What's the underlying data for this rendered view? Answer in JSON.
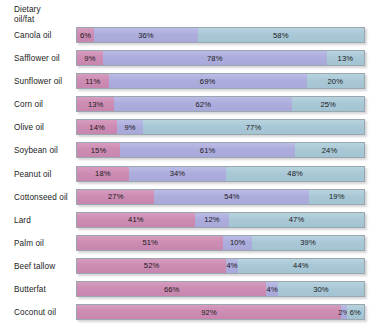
{
  "axis": {
    "title_line1": "Dietary",
    "title_line2": "oil/fat"
  },
  "colors": {
    "saturated": "#cc8cb3",
    "polyunsaturated": "#adaddd",
    "monounsaturated": "#a9c8d6",
    "bar_border": "#9aa7ae",
    "background": "#ffffff",
    "text": "#1c1c1c"
  },
  "chart_data": {
    "type": "bar",
    "orientation": "horizontal",
    "stacked": true,
    "normalized": true,
    "title": "",
    "subtitle": "",
    "xlabel": "",
    "ylabel": "Dietary oil/fat",
    "xlim": [
      0,
      100
    ],
    "grid": false,
    "legend_position": "none",
    "value_suffix": "%",
    "categories": [
      "Canola oil",
      "Safflower oil",
      "Sunflower oil",
      "Corn oil",
      "Olive oil",
      "Soybean oil",
      "Peanut oil",
      "Cottonseed oil",
      "Lard",
      "Palm oil",
      "Beef tallow",
      "Butterfat",
      "Coconut oil"
    ],
    "series": [
      {
        "name": "Saturated fat",
        "color": "#cc8cb3",
        "values": [
          6,
          9,
          11,
          13,
          14,
          15,
          18,
          27,
          41,
          51,
          52,
          66,
          92
        ]
      },
      {
        "name": "Polyunsaturated fat",
        "color": "#adaddd",
        "values": [
          36,
          78,
          69,
          62,
          9,
          61,
          34,
          54,
          12,
          10,
          4,
          4,
          2
        ]
      },
      {
        "name": "Monounsaturated fat",
        "color": "#a9c8d6",
        "values": [
          58,
          13,
          20,
          25,
          77,
          24,
          48,
          19,
          47,
          39,
          44,
          30,
          6
        ]
      }
    ],
    "rows": [
      {
        "label": "Canola oil",
        "segments": [
          {
            "series": "Saturated fat",
            "value": 6,
            "text": "6%"
          },
          {
            "series": "Polyunsaturated fat",
            "value": 36,
            "text": "36%"
          },
          {
            "series": "Monounsaturated fat",
            "value": 58,
            "text": "58%"
          }
        ]
      },
      {
        "label": "Safflower oil",
        "segments": [
          {
            "series": "Saturated fat",
            "value": 9,
            "text": "9%"
          },
          {
            "series": "Polyunsaturated fat",
            "value": 78,
            "text": "78%"
          },
          {
            "series": "Monounsaturated fat",
            "value": 13,
            "text": "13%"
          }
        ]
      },
      {
        "label": "Sunflower oil",
        "segments": [
          {
            "series": "Saturated fat",
            "value": 11,
            "text": "11%"
          },
          {
            "series": "Polyunsaturated fat",
            "value": 69,
            "text": "69%"
          },
          {
            "series": "Monounsaturated fat",
            "value": 20,
            "text": "20%"
          }
        ]
      },
      {
        "label": "Corn oil",
        "segments": [
          {
            "series": "Saturated fat",
            "value": 13,
            "text": "13%"
          },
          {
            "series": "Polyunsaturated fat",
            "value": 62,
            "text": "62%"
          },
          {
            "series": "Monounsaturated fat",
            "value": 25,
            "text": "25%"
          }
        ]
      },
      {
        "label": "Olive oil",
        "segments": [
          {
            "series": "Saturated fat",
            "value": 14,
            "text": "14%"
          },
          {
            "series": "Polyunsaturated fat",
            "value": 9,
            "text": "9%"
          },
          {
            "series": "Monounsaturated fat",
            "value": 77,
            "text": "77%"
          }
        ]
      },
      {
        "label": "Soybean oil",
        "segments": [
          {
            "series": "Saturated fat",
            "value": 15,
            "text": "15%"
          },
          {
            "series": "Polyunsaturated fat",
            "value": 61,
            "text": "61%"
          },
          {
            "series": "Monounsaturated fat",
            "value": 24,
            "text": "24%"
          }
        ]
      },
      {
        "label": "Peanut oil",
        "segments": [
          {
            "series": "Saturated fat",
            "value": 18,
            "text": "18%"
          },
          {
            "series": "Polyunsaturated fat",
            "value": 34,
            "text": "34%"
          },
          {
            "series": "Monounsaturated fat",
            "value": 48,
            "text": "48%"
          }
        ]
      },
      {
        "label": "Cottonseed oil",
        "segments": [
          {
            "series": "Saturated fat",
            "value": 27,
            "text": "27%"
          },
          {
            "series": "Polyunsaturated fat",
            "value": 54,
            "text": "54%"
          },
          {
            "series": "Monounsaturated fat",
            "value": 19,
            "text": "19%"
          }
        ]
      },
      {
        "label": "Lard",
        "segments": [
          {
            "series": "Saturated fat",
            "value": 41,
            "text": "41%"
          },
          {
            "series": "Polyunsaturated fat",
            "value": 12,
            "text": "12%"
          },
          {
            "series": "Monounsaturated fat",
            "value": 47,
            "text": "47%"
          }
        ]
      },
      {
        "label": "Palm oil",
        "segments": [
          {
            "series": "Saturated fat",
            "value": 51,
            "text": "51%"
          },
          {
            "series": "Polyunsaturated fat",
            "value": 10,
            "text": "10%"
          },
          {
            "series": "Monounsaturated fat",
            "value": 39,
            "text": "39%"
          }
        ]
      },
      {
        "label": "Beef tallow",
        "segments": [
          {
            "series": "Saturated fat",
            "value": 52,
            "text": "52%"
          },
          {
            "series": "Polyunsaturated fat",
            "value": 4,
            "text": "4%"
          },
          {
            "series": "Monounsaturated fat",
            "value": 44,
            "text": "44%"
          }
        ]
      },
      {
        "label": "Butterfat",
        "segments": [
          {
            "series": "Saturated fat",
            "value": 66,
            "text": "66%"
          },
          {
            "series": "Polyunsaturated fat",
            "value": 4,
            "text": "4%"
          },
          {
            "series": "Monounsaturated fat",
            "value": 30,
            "text": "30%"
          }
        ]
      },
      {
        "label": "Coconut oil",
        "segments": [
          {
            "series": "Saturated fat",
            "value": 92,
            "text": "92%"
          },
          {
            "series": "Polyunsaturated fat",
            "value": 2,
            "text": "2%"
          },
          {
            "series": "Monounsaturated fat",
            "value": 6,
            "text": "6%"
          }
        ]
      }
    ]
  }
}
